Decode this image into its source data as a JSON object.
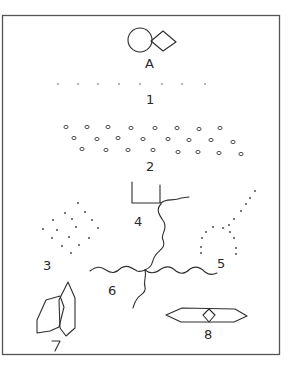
{
  "diagram": {
    "type": "hand-drawn figure panel",
    "colors": {
      "ink": "#2e2e2e",
      "background": "#ffffff",
      "frame": "#555555"
    },
    "frame": {
      "x": 2,
      "y": 15,
      "width": 277,
      "height": 339
    },
    "items": [
      {
        "id": "A",
        "label": "A",
        "description": "circle joined to diamond",
        "label_pos": [
          150,
          68
        ]
      },
      {
        "id": "1",
        "label": "1",
        "description": "horizontal row of small dots",
        "label_pos": [
          150,
          104
        ],
        "dots": [
          [
            58,
            84
          ],
          [
            78,
            84
          ],
          [
            98,
            84
          ],
          [
            119,
            84
          ],
          [
            140,
            84
          ],
          [
            162,
            84
          ],
          [
            182,
            84
          ],
          [
            205,
            84
          ]
        ]
      },
      {
        "id": "2",
        "label": "2",
        "description": "three staggered rows of small rings",
        "label_pos": [
          150,
          170
        ],
        "rings": [
          [
            66,
            127
          ],
          [
            87,
            127
          ],
          [
            108,
            127
          ],
          [
            131,
            128
          ],
          [
            155,
            128
          ],
          [
            177,
            128
          ],
          [
            199,
            129
          ],
          [
            220,
            128
          ],
          [
            74,
            138
          ],
          [
            97,
            139
          ],
          [
            118,
            138
          ],
          [
            143,
            139
          ],
          [
            168,
            139
          ],
          [
            189,
            140
          ],
          [
            211,
            140
          ],
          [
            233,
            142
          ],
          [
            82,
            149
          ],
          [
            106,
            150
          ],
          [
            128,
            150
          ],
          [
            153,
            150
          ],
          [
            178,
            152
          ],
          [
            198,
            152
          ],
          [
            219,
            153
          ],
          [
            241,
            154
          ]
        ]
      },
      {
        "id": "3",
        "label": "3",
        "description": "diamond lattice of dots",
        "label_pos": [
          48,
          270
        ],
        "dots": [
          [
            78,
            203
          ],
          [
            65,
            213
          ],
          [
            85,
            212
          ],
          [
            53,
            220
          ],
          [
            72,
            219
          ],
          [
            92,
            220
          ],
          [
            43,
            229
          ],
          [
            57,
            230
          ],
          [
            76,
            227
          ],
          [
            98,
            228
          ],
          [
            52,
            238
          ],
          [
            69,
            237
          ],
          [
            89,
            238
          ],
          [
            62,
            246
          ],
          [
            79,
            245
          ],
          [
            71,
            253
          ]
        ]
      },
      {
        "id": "4",
        "label": "4",
        "description": "open square cup with wavy tail",
        "label_pos": [
          140,
          226
        ]
      },
      {
        "id": "5",
        "label": "5",
        "description": "dotted curve forming a tail and loop",
        "label_pos": [
          222,
          268
        ],
        "dots": [
          [
            255,
            191
          ],
          [
            250,
            198
          ],
          [
            246,
            204
          ],
          [
            241,
            211
          ],
          [
            234,
            219
          ],
          [
            229,
            225
          ],
          [
            223,
            228
          ],
          [
            213,
            227
          ],
          [
            206,
            232
          ],
          [
            230,
            232
          ],
          [
            202,
            238
          ],
          [
            234,
            238
          ],
          [
            201,
            247
          ],
          [
            236,
            248
          ],
          [
            201,
            253
          ],
          [
            236,
            254
          ]
        ]
      },
      {
        "id": "6",
        "label": "6",
        "description": "four wavy lines meeting at a junction",
        "label_pos": [
          113,
          295
        ]
      },
      {
        "id": "7",
        "label": "7",
        "description": "two overlapping hexagons",
        "label_pos": [
          57,
          347
        ]
      },
      {
        "id": "8",
        "label": "8",
        "description": "elongated hexagon with central diamond",
        "label_pos": [
          208,
          338
        ]
      }
    ]
  }
}
